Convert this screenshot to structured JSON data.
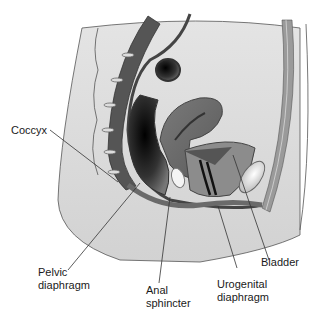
{
  "figure": {
    "labels": {
      "coccyx": "Coccyx",
      "pelvic_diaphragm": "Pelvic\ndiaphragm",
      "anal_sphincter": "Anal\nsphincter",
      "urogenital_diaphragm": "Urogenital\ndiaphragm",
      "bladder": "Bladder"
    }
  }
}
